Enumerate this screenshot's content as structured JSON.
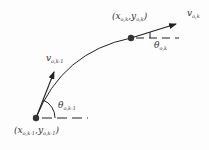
{
  "diagram": {
    "points": [
      {
        "id": "current",
        "label_main_x": "x",
        "label_sub_x": "o,k",
        "label_main_y": "y",
        "label_sub_y": "o,k"
      },
      {
        "id": "previous",
        "label_main_x": "x",
        "label_sub_x": "o,k-1",
        "label_main_y": "y",
        "label_sub_y": "o,k-1"
      }
    ],
    "velocities": [
      {
        "main": "v",
        "sub": "o,k"
      },
      {
        "main": "v",
        "sub": "o,k-1"
      }
    ],
    "angles": [
      {
        "main": "θ",
        "sub": "o,k"
      },
      {
        "main": "θ",
        "sub": "o,k-1"
      }
    ],
    "punct": {
      "open": "(",
      "comma": ",",
      "close": ")"
    },
    "colors": {
      "stroke": "#222222",
      "point": "#333333"
    }
  }
}
